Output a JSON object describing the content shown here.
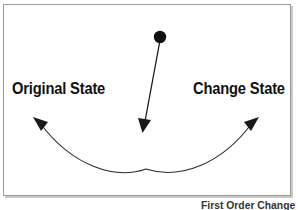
{
  "figure": {
    "caption": "First Order Change",
    "frame": {
      "border_color": "#9a9a9a",
      "background": "#ffffff"
    }
  },
  "labels": {
    "original_state": "Original State",
    "change_state": "Change State"
  },
  "shapes": {
    "origin_dot": {
      "name": "origin-dot",
      "cx": 160,
      "cy": 37,
      "r": 6,
      "color": "#111111"
    },
    "downward_arrow": {
      "name": "downward-arrow",
      "from_x": 159,
      "from_y": 44,
      "to_x": 143,
      "to_y": 133,
      "color": "#111111"
    },
    "curved_double_arrow": {
      "name": "curved-double-arrow",
      "left_tip_x": 33,
      "left_tip_y": 117,
      "right_tip_x": 259,
      "right_tip_y": 117,
      "bottom_x": 146,
      "bottom_y": 169,
      "color": "#2b2b2b"
    }
  },
  "colors": {
    "ink": "#111111",
    "frame": "#9a9a9a",
    "shadow": "#c9c9c9",
    "caption": "#333333"
  }
}
